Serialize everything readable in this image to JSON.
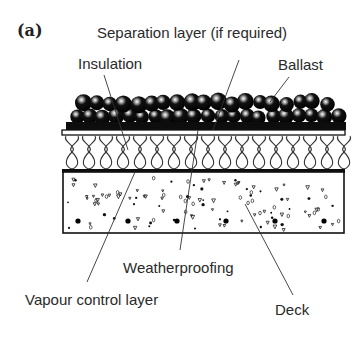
{
  "figure": {
    "panel_label": "(a)"
  },
  "labels": {
    "separation_layer": "Separation layer (if required)",
    "insulation": "Insulation",
    "ballast": "Ballast",
    "weatherproofing": "Weatherproofing",
    "vapour_control_layer": "Vapour control layer",
    "deck": "Deck"
  },
  "layers_top_to_bottom": [
    "Ballast",
    "Separation layer (if required)",
    "Insulation",
    "Weatherproofing",
    "Vapour control layer",
    "Deck"
  ],
  "colors": {
    "ink": "#111111",
    "text": "#2a2a2a",
    "background": "#ffffff"
  }
}
